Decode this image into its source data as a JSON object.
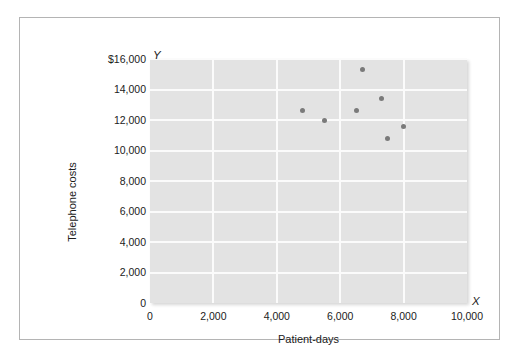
{
  "chart_data": {
    "type": "scatter",
    "title": "",
    "xlabel": "Patient-days",
    "ylabel": "Telephone costs",
    "x_axis_letter": "X",
    "y_axis_letter": "Y",
    "xlim": [
      0,
      10000
    ],
    "ylim": [
      0,
      16000
    ],
    "grid": true,
    "legend": null,
    "xticks": [
      {
        "value": 0,
        "label": "0"
      },
      {
        "value": 2000,
        "label": "2,000"
      },
      {
        "value": 4000,
        "label": "4,000"
      },
      {
        "value": 6000,
        "label": "6,000"
      },
      {
        "value": 8000,
        "label": "8,000"
      },
      {
        "value": 10000,
        "label": "10,000"
      }
    ],
    "yticks": [
      {
        "value": 0,
        "label": "0"
      },
      {
        "value": 2000,
        "label": "2,000"
      },
      {
        "value": 4000,
        "label": "4,000"
      },
      {
        "value": 6000,
        "label": "6,000"
      },
      {
        "value": 8000,
        "label": "8,000"
      },
      {
        "value": 10000,
        "label": "10,000"
      },
      {
        "value": 12000,
        "label": "12,000"
      },
      {
        "value": 14000,
        "label": "14,000"
      },
      {
        "value": 16000,
        "label": "$16,000"
      }
    ],
    "points": [
      {
        "x": 4800,
        "y": 12600
      },
      {
        "x": 5500,
        "y": 11950
      },
      {
        "x": 6500,
        "y": 12600
      },
      {
        "x": 6700,
        "y": 15300
      },
      {
        "x": 7300,
        "y": 13400
      },
      {
        "x": 7500,
        "y": 10800
      },
      {
        "x": 8000,
        "y": 11600
      }
    ],
    "colors": {
      "plot_background": "#e3e3e3",
      "gridline": "#fbfbfb",
      "point": "#7a7a7a",
      "text": "#1b1b1b",
      "frame_border": "#b4b4b4",
      "page_background": "#ffffff"
    }
  }
}
